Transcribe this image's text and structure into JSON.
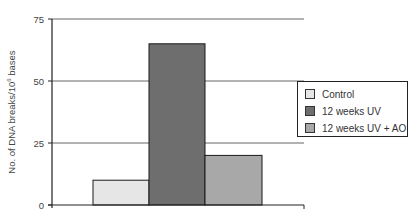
{
  "chart_data": {
    "type": "bar",
    "title": "",
    "xlabel": "",
    "ylabel": "No. of DNA breaks/10⁶ bases",
    "ylabel_parts": {
      "pre": "No. of DNA breaks/10",
      "sup": "6",
      "post": " bases"
    },
    "ylim": [
      0,
      75
    ],
    "yticks": [
      0,
      25,
      50,
      75
    ],
    "grid": true,
    "legend_position": "right",
    "categories": [
      "Control",
      "12 weeks UV",
      "12 weeks UV + AO"
    ],
    "values": [
      10,
      65,
      20
    ],
    "colors": [
      "#e6e6e6",
      "#6e6e6e",
      "#a8a8a8"
    ]
  },
  "legend": {
    "items": [
      {
        "label": "Control",
        "color": "#e6e6e6"
      },
      {
        "label": "12 weeks UV",
        "color": "#6e6e6e"
      },
      {
        "label": "12 weeks UV + AO",
        "color": "#a8a8a8"
      }
    ]
  }
}
